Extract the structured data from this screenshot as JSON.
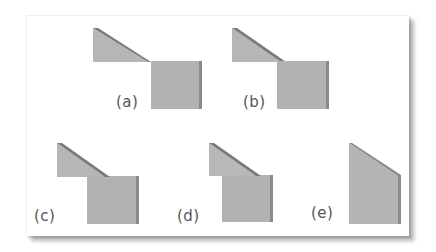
{
  "figure": {
    "panels": [
      {
        "id": "a",
        "label": "(a)"
      },
      {
        "id": "b",
        "label": "(b)"
      },
      {
        "id": "c",
        "label": "(c)"
      },
      {
        "id": "d",
        "label": "(d)"
      },
      {
        "id": "e",
        "label": "(e)"
      }
    ],
    "colors": {
      "face": "#b4b4b4",
      "face_light": "#bdbdbd",
      "edge_dark": "#7d7d7d",
      "label": "#555555",
      "background": "#ffffff"
    }
  }
}
